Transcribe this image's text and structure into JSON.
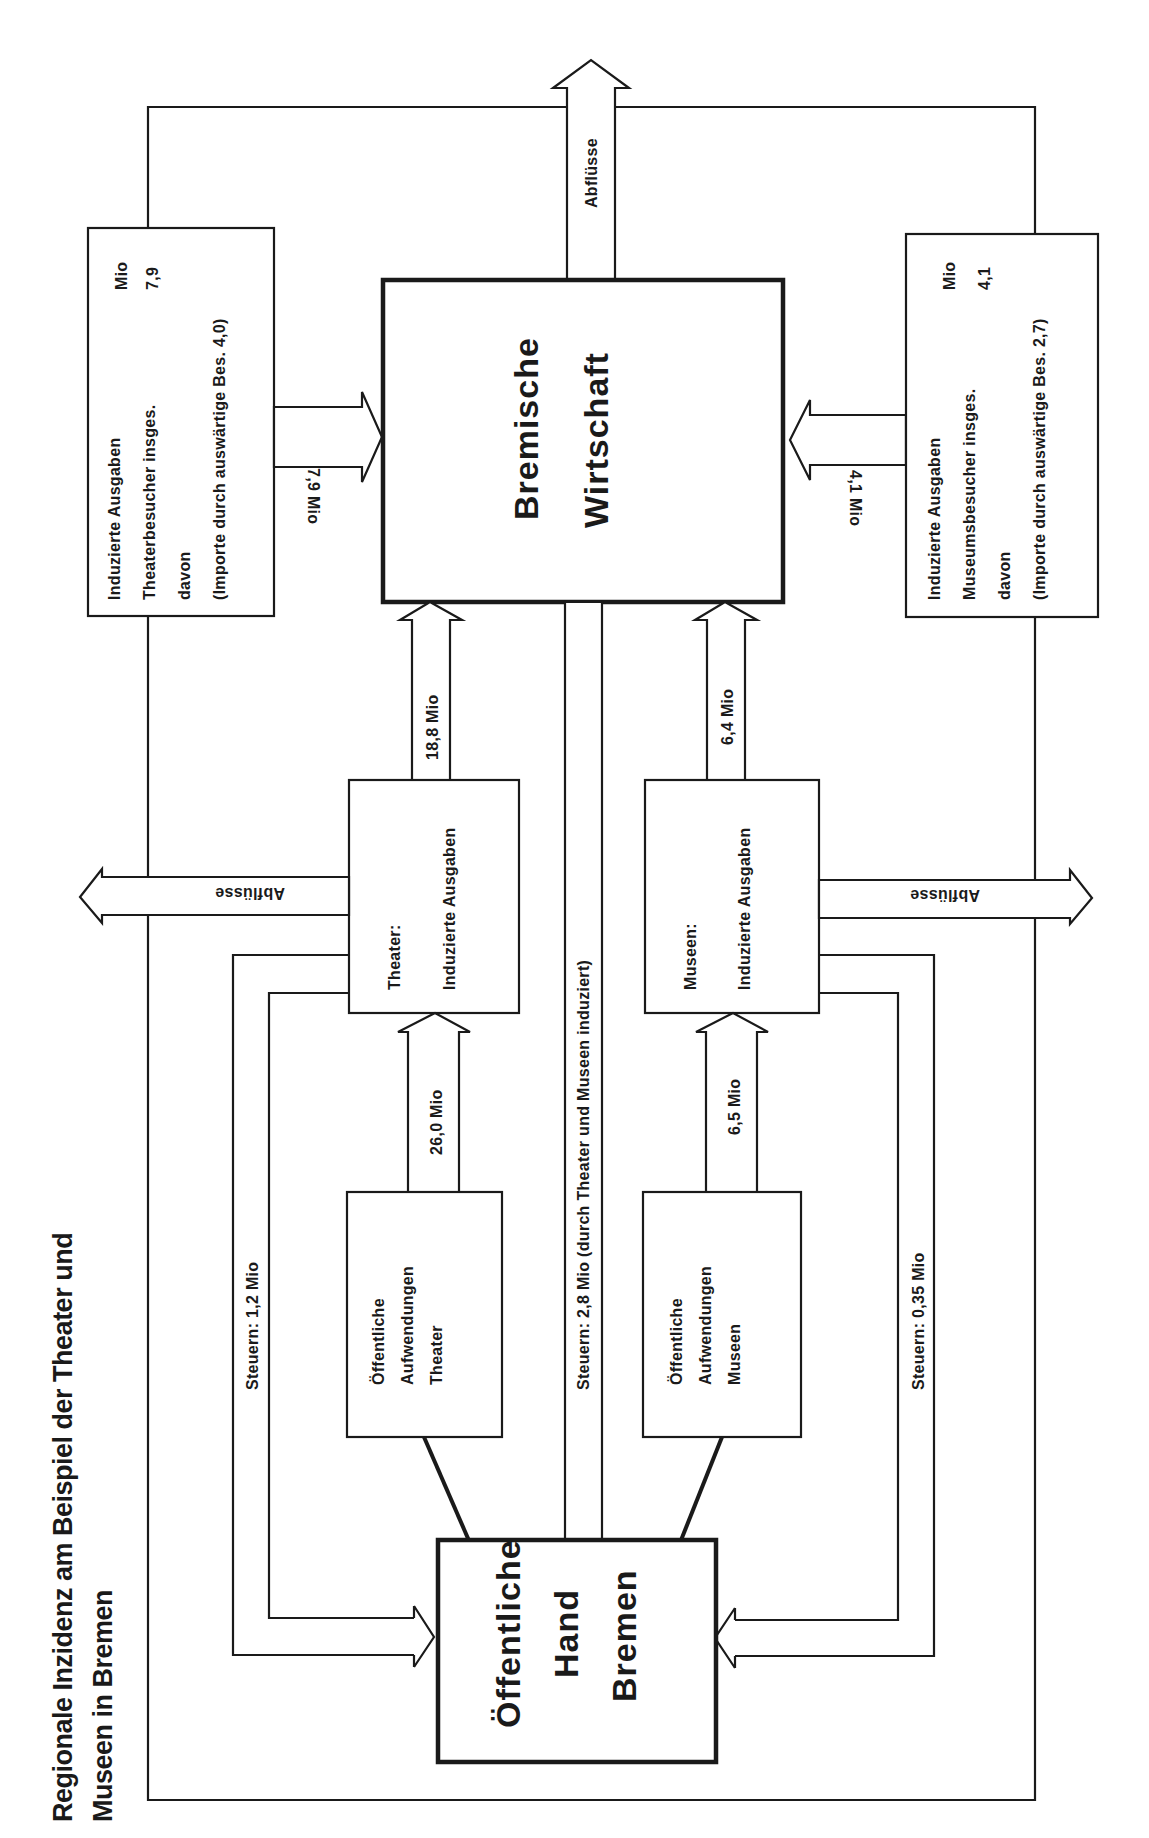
{
  "title": {
    "line1": "Regionale Inzidenz am Beispiel der Theater und",
    "line2": "Museen in Bremen"
  },
  "nodes": {
    "bremische_wirtschaft": {
      "line1": "Bremische",
      "line2": "Wirtschaft"
    },
    "oeffentliche_hand": {
      "line1": "Öffentliche",
      "line2": "Hand",
      "line3": "Bremen"
    },
    "aufwendungen_theater": {
      "line1": "Öffentliche",
      "line2": "Aufwendungen",
      "line3": "Theater"
    },
    "aufwendungen_museen": {
      "line1": "Öffentliche",
      "line2": "Aufwendungen",
      "line3": "Museen"
    },
    "theater_induziert": {
      "line1": "Theater:",
      "line2": "Induzierte Ausgaben"
    },
    "museen_induziert": {
      "line1": "Museen:",
      "line2": "Induzierte Ausgaben"
    },
    "theaterbesucher": {
      "line1": "Induzierte Ausgaben",
      "line2": "Theaterbesucher insges.",
      "line3": "davon",
      "line4": "(Importe durch  auswärtige Bes.  4,0)",
      "unit": "Mio",
      "value": "7,9"
    },
    "museumsbesucher": {
      "line1": "Induzierte Ausgaben",
      "line2": "Museumsbesucher insges.",
      "line3": "davon",
      "line4": "(Importe durch  auswärtige Bes. 2,7)",
      "unit": "Mio",
      "value": "4,1"
    }
  },
  "flows": {
    "abfluesse_top": "Abflüsse",
    "abfluesse_left": "Abflüsse",
    "abfluesse_right": "Abflüsse",
    "theaterbesucher_to_wirtschaft": "7,9 Mio",
    "museumsbesucher_to_wirtschaft": "4,1 Mio",
    "theater_to_wirtschaft": "18,8 Mio",
    "museen_to_wirtschaft": "6,4 Mio",
    "aufwendungen_theater_to_theater": "26,0 Mio",
    "aufwendungen_museen_to_museen": "6,5 Mio",
    "steuern_theater": "Steuern: 1,2 Mio",
    "steuern_museen": "Steuern: 0,35 Mio",
    "steuern_wirtschaft": "Steuern:  2,8 Mio  (durch Theater und Museen induziert)"
  },
  "colors": {
    "ink": "#1a1a1a",
    "paper": "#ffffff"
  }
}
